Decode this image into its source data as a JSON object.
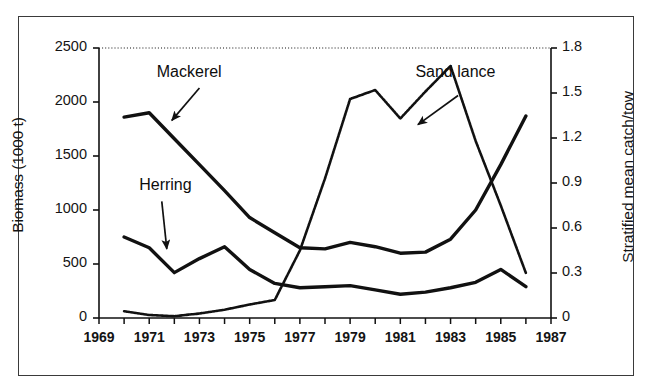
{
  "figure": {
    "background_color": "#ffffff",
    "frame_color": "#3a3a3a",
    "line_color": "#111111"
  },
  "chart_data": {
    "type": "line",
    "title": "",
    "xlabel": "",
    "ylabel": "Biomass (1000 t)",
    "y2label": "Stratified mean catch/tow",
    "grid": false,
    "legend_position": "inline-annotations",
    "xlim": [
      1969,
      1987
    ],
    "ylim": [
      0,
      2500
    ],
    "y2lim": [
      0,
      1.8
    ],
    "x_tick_interval": 1,
    "x_labeled_ticks": [
      1969,
      1971,
      1973,
      1975,
      1977,
      1979,
      1981,
      1983,
      1985,
      1987
    ],
    "y_ticks": [
      0,
      500,
      1000,
      1500,
      2000,
      2500
    ],
    "y2_ticks": [
      0,
      0.3,
      0.6,
      0.9,
      1.2,
      1.5,
      1.8
    ],
    "x": [
      1970,
      1971,
      1972,
      1973,
      1974,
      1975,
      1976,
      1977,
      1978,
      1979,
      1980,
      1981,
      1982,
      1983,
      1984,
      1985,
      1986
    ],
    "series": [
      {
        "name": "Mackerel",
        "axis": "left",
        "style": "solid",
        "values": [
          1860,
          1900,
          1660,
          1420,
          1180,
          930,
          790,
          650,
          640,
          700,
          660,
          600,
          610,
          730,
          1000,
          1420,
          1870
        ]
      },
      {
        "name": "Herring",
        "axis": "left",
        "style": "solid",
        "values": [
          750,
          650,
          420,
          550,
          660,
          450,
          320,
          280,
          290,
          300,
          260,
          220,
          240,
          280,
          330,
          450,
          290
        ]
      },
      {
        "name": "Sand lance",
        "axis": "right",
        "style": "dotted",
        "values": [
          0.045,
          0.02,
          0.012,
          0.03,
          0.055,
          0.09,
          0.12,
          0.45,
          0.93,
          1.46,
          1.52,
          1.33,
          1.51,
          1.68,
          1.18,
          0.75,
          0.3
        ]
      }
    ],
    "annotations": [
      {
        "label": "Mackerel",
        "label_x": 1971.3,
        "label_y": 2260,
        "arrow_from_x": 1973.0,
        "arrow_from_y": 2130,
        "arrow_to_x": 1971.9,
        "arrow_to_y": 1830
      },
      {
        "label": "Herring",
        "label_x": 1970.6,
        "label_y": 1215,
        "arrow_from_x": 1971.5,
        "arrow_from_y": 1080,
        "arrow_to_x": 1971.7,
        "arrow_to_y": 640
      },
      {
        "label": "Sand lance",
        "label_x": 1981.6,
        "label_y": 2260,
        "arrow_from_x": 1983.3,
        "arrow_from_y": 2060,
        "arrow_to_x": 1981.7,
        "arrow_to_y": 1790
      }
    ]
  }
}
